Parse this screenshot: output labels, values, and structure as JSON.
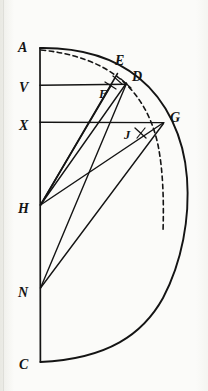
{
  "figure": {
    "background_color": "#fbfbf9",
    "ink_color": "#141414",
    "labels": [
      {
        "id": "A",
        "text": "A",
        "x": 18,
        "y": 52,
        "size": "large"
      },
      {
        "id": "V",
        "text": "V",
        "x": 19,
        "y": 92,
        "size": "large"
      },
      {
        "id": "X",
        "text": "X",
        "x": 19,
        "y": 130,
        "size": "large"
      },
      {
        "id": "H",
        "text": "H",
        "x": 19,
        "y": 213,
        "size": "large"
      },
      {
        "id": "N",
        "text": "N",
        "x": 19,
        "y": 297,
        "size": "large"
      },
      {
        "id": "C",
        "text": "C",
        "x": 19,
        "y": 369,
        "size": "large"
      },
      {
        "id": "E",
        "text": "E",
        "x": 115,
        "y": 65,
        "size": "large"
      },
      {
        "id": "D",
        "text": "D",
        "x": 132,
        "y": 81,
        "size": "large"
      },
      {
        "id": "F",
        "text": "F",
        "x": 99,
        "y": 98,
        "size": "large"
      },
      {
        "id": "G",
        "text": "G",
        "x": 171,
        "y": 122,
        "size": "large"
      },
      {
        "id": "J",
        "text": "J",
        "x": 124,
        "y": 139,
        "size": "large"
      }
    ],
    "points": [
      {
        "id": "A",
        "x": 40,
        "y": 48
      },
      {
        "id": "V",
        "x": 40,
        "y": 85
      },
      {
        "id": "X",
        "x": 40,
        "y": 122
      },
      {
        "id": "H",
        "x": 40,
        "y": 205
      },
      {
        "id": "N",
        "x": 40,
        "y": 288
      },
      {
        "id": "C",
        "x": 40,
        "y": 362
      },
      {
        "id": "E",
        "x": 117,
        "y": 74
      },
      {
        "id": "D",
        "x": 126,
        "y": 83
      },
      {
        "id": "F",
        "x": 110,
        "y": 86
      },
      {
        "id": "G",
        "x": 163,
        "y": 123
      },
      {
        "id": "J",
        "x": 140,
        "y": 133
      }
    ],
    "segments": [
      {
        "id": "axis-AC",
        "from": "A",
        "to": "C",
        "style": "solid"
      },
      {
        "id": "chord-VD",
        "from": "V",
        "to": "D",
        "style": "solid"
      },
      {
        "id": "chord-XG",
        "from": "X",
        "to": "G",
        "style": "solid"
      },
      {
        "id": "ray-HE",
        "from": "H",
        "to": "E",
        "style": "solid"
      },
      {
        "id": "ray-HF",
        "from": "H",
        "to": "F",
        "style": "solid"
      },
      {
        "id": "ray-HD",
        "from": "H",
        "to": "D",
        "style": "solid"
      },
      {
        "id": "ray-HG",
        "from": "H",
        "to": "G",
        "style": "solid"
      },
      {
        "id": "ray-ND",
        "from": "N",
        "to": "D",
        "style": "solid"
      },
      {
        "id": "ray-NG",
        "from": "N",
        "to": "G",
        "style": "solid"
      }
    ],
    "arcs": [
      {
        "id": "semicircle-ADGC",
        "type": "solid",
        "center": "H",
        "radius": 157,
        "from_point": "A",
        "to_point": "C"
      },
      {
        "id": "inner-dashed-arc",
        "type": "dashed",
        "from_point": "A",
        "to_point": "below-G"
      }
    ]
  }
}
